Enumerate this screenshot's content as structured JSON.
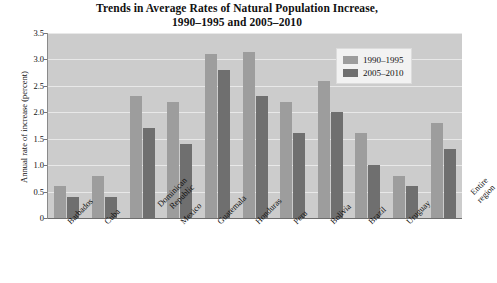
{
  "chart_data": {
    "type": "bar",
    "title": "Trends in Average Rates of Natural Population Increase, 1990–1995 and 2005–2010",
    "title_lines": [
      "Trends in Average Rates of Natural Population Increase,",
      "1990–1995 and 2005–2010"
    ],
    "xlabel": "",
    "ylabel": "Annual rate of increase (percent)",
    "ylim": [
      0,
      3.5
    ],
    "ytick_labels": [
      "3.5",
      "3.0",
      "2.5",
      "2.0",
      "1.5",
      "1.0",
      "0.5",
      "0"
    ],
    "ytick_values": [
      3.5,
      3.0,
      2.5,
      2.0,
      1.5,
      1.0,
      0.5,
      0
    ],
    "grid": true,
    "grid_axis": "y",
    "legend_position": "top-right",
    "categories": [
      "Barbados",
      "Cuba",
      "Dominican Republic",
      "Mexico",
      "Guatemala",
      "Honduras",
      "Peru",
      "Bolivia",
      "Brazil",
      "Uruguay",
      "Entire region"
    ],
    "series": [
      {
        "name": "1990–1995",
        "color": "#9d9d9d",
        "values": [
          0.6,
          0.8,
          2.3,
          2.2,
          3.1,
          3.15,
          2.2,
          2.6,
          1.6,
          0.8,
          1.8
        ]
      },
      {
        "name": "2005–2010",
        "color": "#6f6f6f",
        "values": [
          0.4,
          0.4,
          1.7,
          1.4,
          2.8,
          2.3,
          1.6,
          2.0,
          1.0,
          0.6,
          1.3
        ]
      }
    ],
    "plot_background": "#cccccc",
    "figure_background": "#ffffff"
  }
}
